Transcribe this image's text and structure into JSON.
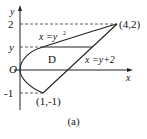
{
  "diagram": {
    "caption": "(a)",
    "axes": {
      "x_label": "x",
      "y_label": "y",
      "origin_label": "O"
    },
    "tick_labels": {
      "y_top": "2",
      "y_mid": "y",
      "y_neg": "-1"
    },
    "point_labels": {
      "upper": "(4,2)",
      "lower": "(1,-1)"
    },
    "curve_labels": {
      "parabola": "x =y",
      "parabola_exp": "2",
      "line": "x =y+2"
    },
    "region_label": "D",
    "points": [
      {
        "x": 4,
        "y": 2
      },
      {
        "x": 1,
        "y": -1
      }
    ],
    "curves": [
      "x = y^2",
      "x = y + 2"
    ]
  }
}
